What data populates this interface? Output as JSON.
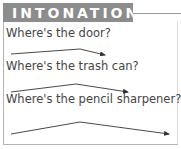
{
  "header": {
    "title": "INTONATION",
    "bar_color": "#8c8c8c",
    "text_color": "#ffffff"
  },
  "phrases": [
    {
      "text": "Where's the door?",
      "intonation": "rise-fall"
    },
    {
      "text": "Where's the trash can?",
      "intonation": "rise-fall"
    },
    {
      "text": "Where's the pencil sharpener?",
      "intonation": "rise-fall"
    }
  ],
  "colors": {
    "text": "#444444",
    "arrow": "#333333",
    "border": "#b5b5b5"
  }
}
